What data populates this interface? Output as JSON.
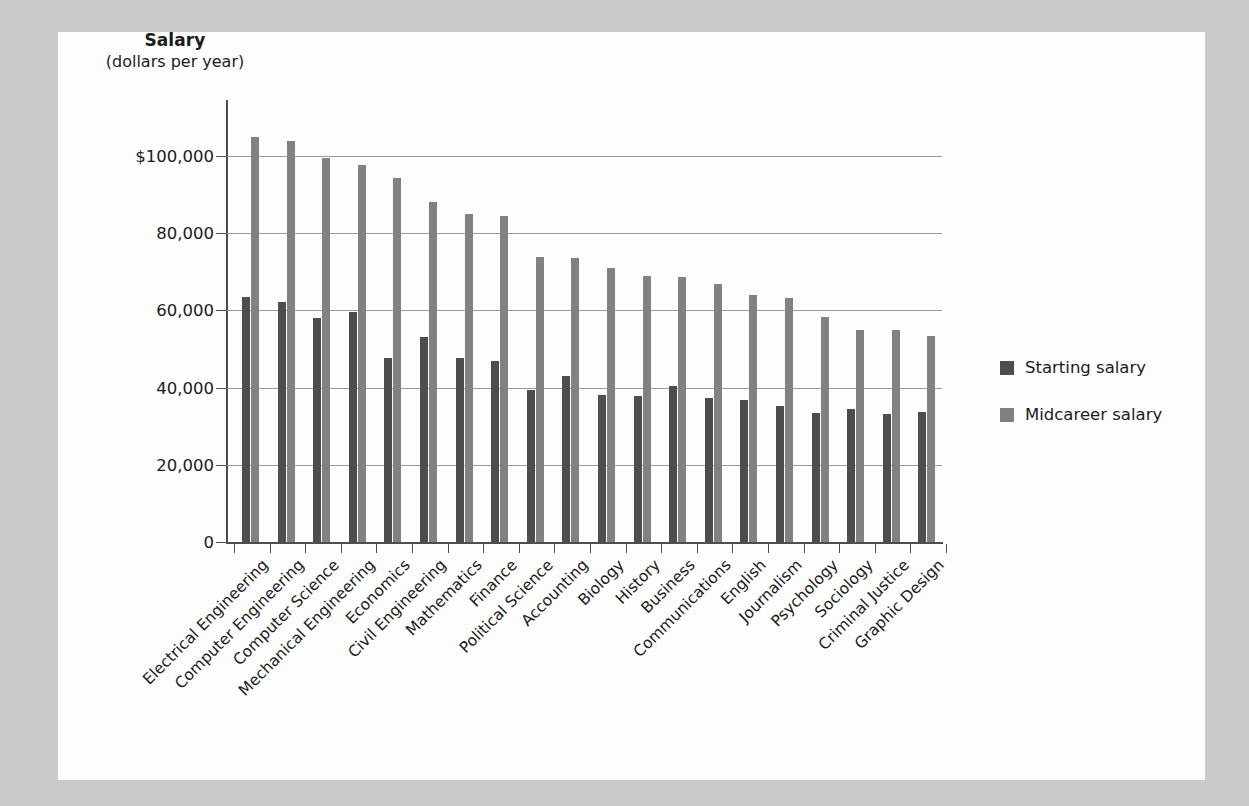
{
  "figure": {
    "background_color": "#c9cacb",
    "panel_color": "#fdfdfd"
  },
  "axis_title": {
    "main": "Salary",
    "sub": "(dollars per year)"
  },
  "legend": {
    "position": "right",
    "entries": [
      {
        "label": "Starting salary",
        "color": "#4d4d4d",
        "swatch_name": "legend-swatch-starting"
      },
      {
        "label": "Midcareer salary",
        "color": "#818181",
        "swatch_name": "legend-swatch-midcareer"
      }
    ]
  },
  "y_axis": {
    "ticks": [
      "$100,000",
      "80,000",
      "60,000",
      "40,000",
      "20,000",
      "0"
    ],
    "values": [
      100000,
      80000,
      60000,
      40000,
      20000,
      0
    ],
    "min": 0,
    "max": 114000
  },
  "chart_data": {
    "type": "bar",
    "title": "Salary",
    "subtitle": "(dollars per year)",
    "xlabel": "",
    "ylabel": "Salary (dollars per year)",
    "ylim": [
      0,
      114000
    ],
    "ytick_labels": [
      "0",
      "20,000",
      "40,000",
      "60,000",
      "80,000",
      "$100,000"
    ],
    "ytick_values": [
      0,
      20000,
      40000,
      60000,
      80000,
      100000
    ],
    "grid": true,
    "legend_position": "right",
    "categories": [
      "Electrical Engineering",
      "Computer Engineering",
      "Computer Science",
      "Mechanical Engineering",
      "Economics",
      "Civil Engineering",
      "Mathematics",
      "Finance",
      "Political Science",
      "Accounting",
      "Biology",
      "History",
      "Business",
      "Communications",
      "English",
      "Journalism",
      "Psychology",
      "Sociology",
      "Criminal Justice",
      "Graphic Design"
    ],
    "series": [
      {
        "name": "Starting salary",
        "color": "#4d4d4d",
        "values": [
          63400,
          62300,
          58000,
          59600,
          47800,
          53200,
          47700,
          46800,
          39300,
          43100,
          38000,
          37900,
          40300,
          37400,
          36700,
          35300,
          33500,
          34400,
          33200,
          33600
        ]
      },
      {
        "name": "Midcareer salary",
        "color": "#818181",
        "values": [
          105000,
          104000,
          99500,
          97800,
          94200,
          88200,
          85000,
          84500,
          73900,
          73600,
          71000,
          69000,
          68600,
          66800,
          64000,
          63100,
          58400,
          54800,
          54800,
          53500
        ]
      }
    ]
  }
}
